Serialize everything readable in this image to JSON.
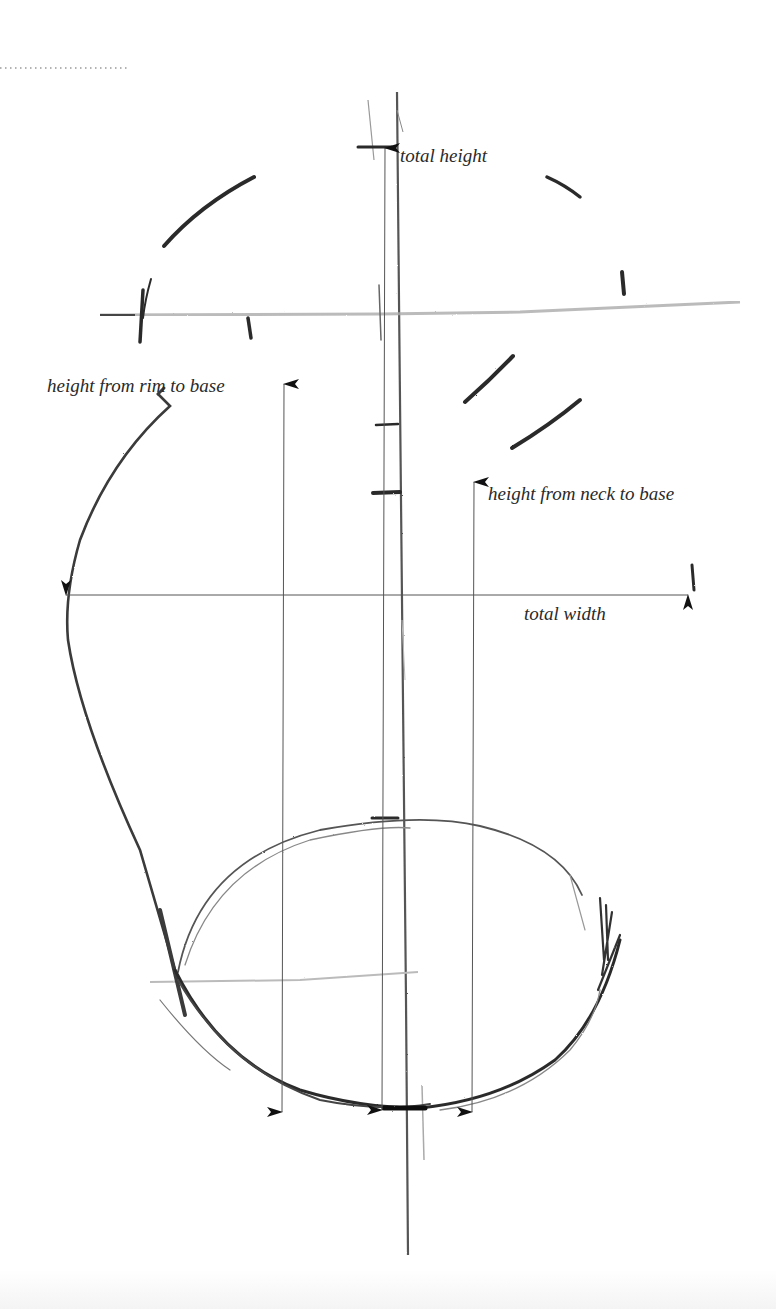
{
  "diagram": {
    "type": "pencil-sketch-measurement-guide",
    "labels": {
      "total_height": "total height",
      "height_rim_to_base": "height from rim to base",
      "height_neck_to_base": "height from neck to base",
      "total_width": "total width"
    },
    "measurements": [
      {
        "name": "total height",
        "direction": "vertical",
        "from": "base",
        "to": "top"
      },
      {
        "name": "height from rim to base",
        "direction": "vertical",
        "from": "base",
        "to": "rim"
      },
      {
        "name": "height from neck to base",
        "direction": "vertical",
        "from": "base",
        "to": "neck"
      },
      {
        "name": "total width",
        "direction": "horizontal",
        "from": "left edge",
        "to": "right edge"
      }
    ],
    "colors": {
      "pencil_dark": "#2b2b2b",
      "pencil_light": "#9a9a9a",
      "ink_line": "#555555",
      "background": "#ffffff"
    }
  }
}
